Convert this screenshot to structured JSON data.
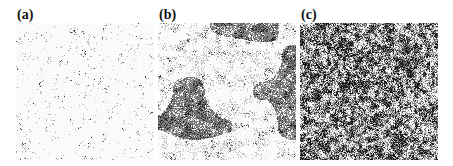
{
  "figure": {
    "panels": [
      {
        "id": "a",
        "label": "(a)",
        "description": "sparse dark speckles on white background",
        "dark_fraction": 0.14,
        "cluster_scale": "fine",
        "tone": "light"
      },
      {
        "id": "b",
        "label": "(b)",
        "description": "large gray domains with dark clusters in white matrix",
        "dark_fraction": 0.45,
        "cluster_scale": "coarse",
        "tone": "mixed"
      },
      {
        "id": "c",
        "label": "(c)",
        "description": "dense fine-grained dark/gray texture",
        "dark_fraction": 0.62,
        "cluster_scale": "medium",
        "tone": "dark"
      }
    ]
  }
}
